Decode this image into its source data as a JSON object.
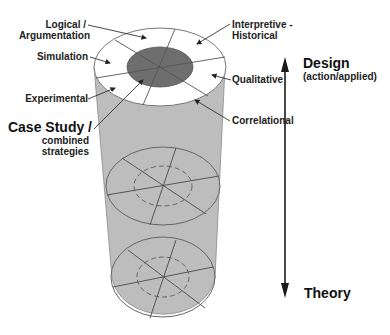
{
  "diagram": {
    "title": "",
    "segments": {
      "logical": "Logical /",
      "logical_2": "Argumentation",
      "interpretive": "Interpretive -",
      "interpretive_2": "Historical",
      "simulation": "Simulation",
      "qualitative": "Qualitative",
      "experimental": "Experimental",
      "correlational": "Correlational",
      "case_study": "Case Study /",
      "case_study_2": "combined",
      "case_study_3": "strategies"
    },
    "axis": {
      "top_label": "Design",
      "top_sublabel": "(action/applied)",
      "bottom_label": "Theory"
    },
    "colors": {
      "cylinder_body": "#bdbdbd",
      "top_face": "#ffffff",
      "core": "#6e6e6e",
      "lines": "#555555",
      "arrow": "#1a1a1a"
    }
  }
}
